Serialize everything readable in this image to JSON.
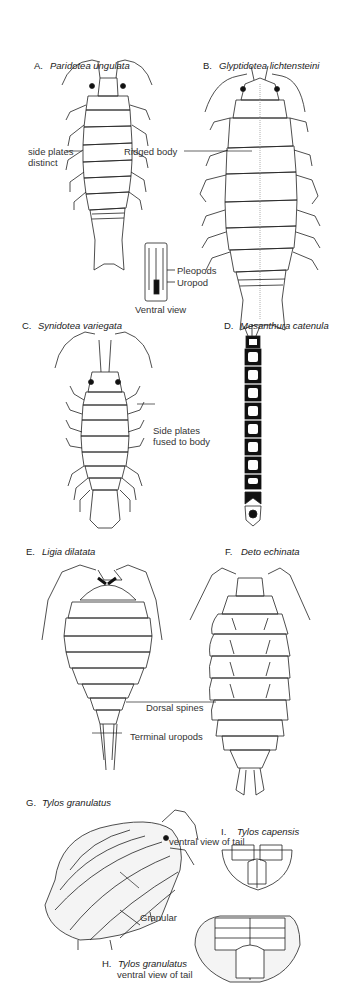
{
  "figures": [
    {
      "letter": "A.",
      "species": "Paridotea ungulata",
      "notes": [
        "side plates",
        "distinct"
      ]
    },
    {
      "letter": "B.",
      "species": "Glyptidotea lichtensteini",
      "notes": [
        "Ridged body"
      ]
    },
    {
      "letter": "C.",
      "species": "Synidotea variegata",
      "notes": [
        "Side plates",
        "fused to body"
      ]
    },
    {
      "letter": "D.",
      "species": "Mesanthura catenula",
      "notes": []
    },
    {
      "letter": "E.",
      "species": "Ligia dilatata",
      "notes": [
        "Terminal uropods"
      ]
    },
    {
      "letter": "F.",
      "species": "Deto echinata",
      "notes": [
        "Dorsal spines"
      ]
    },
    {
      "letter": "G.",
      "species": "Tylos granulatus",
      "notes": [
        "Granular"
      ]
    },
    {
      "letter": "H.",
      "species": "Tylos granulatus",
      "subtitle": "ventral view of tail"
    },
    {
      "letter": "I.",
      "species": "Tylos capensis",
      "subtitle": "ventral view of tail"
    }
  ],
  "inset": {
    "pleopods": "Pleopods",
    "uropod": "Uropod",
    "caption": "Ventral view"
  }
}
